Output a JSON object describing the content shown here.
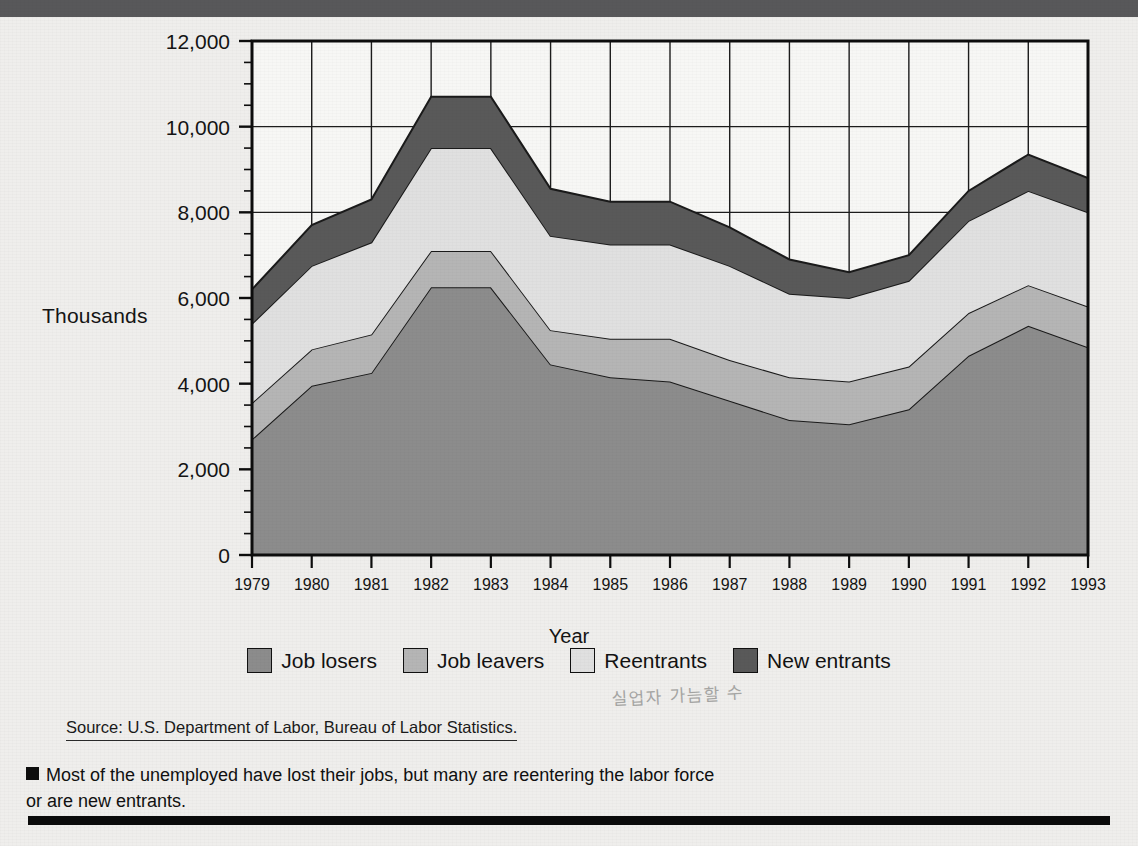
{
  "figure": {
    "y_axis_label": "Thousands",
    "x_axis_label": "Year",
    "source": "Source: U.S. Department of Labor, Bureau of Labor Statistics.",
    "caption": "Most of the unemployed have lost their jobs, but many are reentering the labor force or are new entrants.",
    "handwritten_note": "실업자 가늠할 수"
  },
  "legend": {
    "items": [
      {
        "label": "Job losers",
        "color": "#8c8c8c"
      },
      {
        "label": "Job leavers",
        "color": "#b5b5b5"
      },
      {
        "label": "Reentrants",
        "color": "#e0e0e0"
      },
      {
        "label": "New entrants",
        "color": "#595959"
      }
    ]
  },
  "chart_data": {
    "type": "area",
    "stacked": true,
    "title": "",
    "xlabel": "Year",
    "ylabel": "Thousands",
    "ylim": [
      0,
      12000
    ],
    "xlim": [
      1979,
      1993
    ],
    "ytick_step": 2000,
    "yticks": [
      0,
      2000,
      4000,
      6000,
      8000,
      10000,
      12000
    ],
    "ytick_labels": [
      "0",
      "2,000",
      "4,000",
      "6,000",
      "8,000",
      "10,000",
      "12,000"
    ],
    "minor_ytick_step": 500,
    "grid": true,
    "legend_position": "bottom",
    "categories": [
      1979,
      1980,
      1981,
      1982,
      1983,
      1984,
      1985,
      1986,
      1987,
      1988,
      1989,
      1990,
      1991,
      1992,
      1993
    ],
    "x": [
      "1979",
      "1980",
      "1981",
      "1982",
      "1983",
      "1984",
      "1985",
      "1986",
      "1987",
      "1988",
      "1989",
      "1990",
      "1991",
      "1992",
      "1993"
    ],
    "series": [
      {
        "name": "Job losers",
        "color": "#8c8c8c",
        "values": [
          2700,
          3950,
          4250,
          6250,
          6250,
          4450,
          4150,
          4050,
          3600,
          3150,
          3050,
          3400,
          4650,
          5350,
          4850
        ]
      },
      {
        "name": "Job leavers",
        "color": "#b5b5b5",
        "values": [
          850,
          850,
          900,
          850,
          850,
          800,
          900,
          1000,
          950,
          1000,
          1000,
          1000,
          1000,
          950,
          950
        ]
      },
      {
        "name": "Reentrants",
        "color": "#e0e0e0",
        "values": [
          1850,
          1950,
          2150,
          2400,
          2400,
          2200,
          2200,
          2200,
          2200,
          1950,
          1950,
          2000,
          2150,
          2200,
          2200
        ]
      },
      {
        "name": "New entrants",
        "color": "#595959",
        "values": [
          800,
          950,
          1000,
          1200,
          1200,
          1100,
          1000,
          1000,
          900,
          800,
          600,
          600,
          700,
          850,
          800
        ]
      }
    ],
    "totals": [
      6200,
      7700,
      8300,
      10700,
      10700,
      8550,
      8250,
      8250,
      7650,
      6900,
      6600,
      7000,
      8500,
      9350,
      8800
    ]
  }
}
